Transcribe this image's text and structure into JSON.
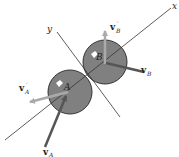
{
  "diagram": {
    "type": "collision-of-two-spheres",
    "axes": {
      "x": {
        "label": "x"
      },
      "y": {
        "label": "y"
      }
    },
    "bodies": [
      {
        "id": "A",
        "label": "A",
        "color": "#808080"
      },
      {
        "id": "B",
        "label": "B",
        "color": "#808080"
      }
    ],
    "vectors": [
      {
        "id": "vA",
        "base": "v",
        "sub": "A",
        "prime": false,
        "color": "#555555"
      },
      {
        "id": "vA_prime",
        "base": "v",
        "sub": "A",
        "prime": true,
        "color": "#aaaaaa"
      },
      {
        "id": "vB",
        "base": "v",
        "sub": "B",
        "prime": false,
        "color": "#555555"
      },
      {
        "id": "vB_prime",
        "base": "v",
        "sub": "B",
        "prime": true,
        "color": "#aaaaaa"
      }
    ],
    "prime_mark": "′"
  }
}
